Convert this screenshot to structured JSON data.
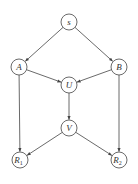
{
  "diagram": {
    "type": "directed-graph",
    "colors": {
      "stroke": "#444444",
      "background": "#ffffff",
      "text": "#333333"
    },
    "nodes": [
      {
        "id": "s",
        "label": "s",
        "sub": "",
        "x": 69,
        "y": 22
      },
      {
        "id": "A",
        "label": "A",
        "sub": "",
        "x": 19,
        "y": 67
      },
      {
        "id": "B",
        "label": "B",
        "sub": "",
        "x": 119,
        "y": 67
      },
      {
        "id": "U",
        "label": "U",
        "sub": "",
        "x": 69,
        "y": 85
      },
      {
        "id": "V",
        "label": "V",
        "sub": "",
        "x": 69,
        "y": 128
      },
      {
        "id": "R1",
        "label": "R",
        "sub": "1",
        "x": 20,
        "y": 160
      },
      {
        "id": "R2",
        "label": "R",
        "sub": "2",
        "x": 119,
        "y": 160
      }
    ],
    "edges": [
      {
        "from": "s",
        "to": "A"
      },
      {
        "from": "s",
        "to": "B"
      },
      {
        "from": "A",
        "to": "U"
      },
      {
        "from": "B",
        "to": "U"
      },
      {
        "from": "U",
        "to": "V"
      },
      {
        "from": "A",
        "to": "R1"
      },
      {
        "from": "B",
        "to": "R2"
      },
      {
        "from": "V",
        "to": "R1"
      },
      {
        "from": "V",
        "to": "R2"
      }
    ]
  }
}
